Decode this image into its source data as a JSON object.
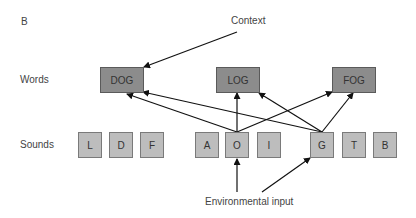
{
  "panel_label": "B",
  "context_label": "Context",
  "environment_label": "Environmental input",
  "row_labels": {
    "words": "Words",
    "sounds": "Sounds"
  },
  "words": [
    {
      "id": "dog",
      "label": "DOG"
    },
    {
      "id": "log",
      "label": "LOG"
    },
    {
      "id": "fog",
      "label": "FOG"
    }
  ],
  "sounds": [
    {
      "id": "l",
      "label": "L"
    },
    {
      "id": "d",
      "label": "D"
    },
    {
      "id": "f",
      "label": "F"
    },
    {
      "id": "a",
      "label": "A"
    },
    {
      "id": "o",
      "label": "O"
    },
    {
      "id": "i",
      "label": "I"
    },
    {
      "id": "g",
      "label": "G"
    },
    {
      "id": "t",
      "label": "T"
    },
    {
      "id": "b",
      "label": "B"
    }
  ],
  "connections": [
    {
      "from": "Context",
      "to": "DOG"
    },
    {
      "from": "O",
      "to": "DOG"
    },
    {
      "from": "O",
      "to": "LOG"
    },
    {
      "from": "O",
      "to": "FOG"
    },
    {
      "from": "G",
      "to": "DOG"
    },
    {
      "from": "G",
      "to": "LOG"
    },
    {
      "from": "G",
      "to": "FOG"
    },
    {
      "from": "Environmental input",
      "to": "O"
    },
    {
      "from": "Environmental input",
      "to": "G"
    }
  ],
  "colors": {
    "word_box": "#8c8c8c",
    "sound_box": "#bdbdbd",
    "arrow": "#111111"
  }
}
